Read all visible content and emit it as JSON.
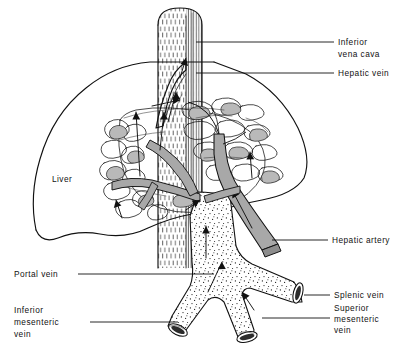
{
  "figure": {
    "background_color": "#ffffff",
    "ink_color": "#111111",
    "vessel_gray": "#a8a8a8",
    "lobule_gray": "#b9b9b9"
  },
  "labels": {
    "liver": "Liver",
    "inferior_vena_cava_line1": "Inferior",
    "inferior_vena_cava_line2": "vena cava",
    "hepatic_vein": "Hepatic vein",
    "hepatic_artery": "Hepatic artery",
    "splenic_vein": "Splenic vein",
    "superior_mesenteric_line1": "Superior",
    "superior_mesenteric_line2": "mesenteric",
    "superior_mesenteric_line3": "vein",
    "portal_vein": "Portal vein",
    "inferior_mesenteric_line1": "Inferior",
    "inferior_mesenteric_line2": "mesenteric",
    "inferior_mesenteric_line3": "vein"
  },
  "structures": [
    {
      "name": "inferior-vena-cava",
      "texture": "vertical-hatch",
      "orientation": "vertical"
    },
    {
      "name": "hepatic-vein",
      "texture": "outline",
      "orientation": "vertical"
    },
    {
      "name": "liver",
      "texture": "outline",
      "orientation": "lobe"
    },
    {
      "name": "hepatic-sinusoid-network",
      "texture": "lobules",
      "orientation": "radial"
    },
    {
      "name": "portal-vein",
      "texture": "stipple",
      "orientation": "vertical"
    },
    {
      "name": "hepatic-artery",
      "texture": "solid-gray",
      "orientation": "diagonal"
    },
    {
      "name": "splenic-vein",
      "texture": "stipple",
      "orientation": "right-branch"
    },
    {
      "name": "superior-mesenteric-vein",
      "texture": "stipple",
      "orientation": "lower-right-branch"
    },
    {
      "name": "inferior-mesenteric-vein",
      "texture": "stipple",
      "orientation": "lower-left-branch"
    }
  ]
}
